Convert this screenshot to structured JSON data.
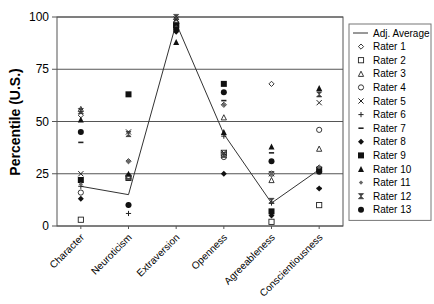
{
  "chart_data": {
    "type": "scatter",
    "title": "",
    "xlabel": "",
    "ylabel": "Percentile (U.S.)",
    "ylim": [
      0,
      100
    ],
    "yticks": [
      0,
      25,
      50,
      75,
      100
    ],
    "grid": "horizontal",
    "legend_position": "right",
    "categories": [
      "Character",
      "Neuroticism",
      "Extraversion",
      "Openness",
      "Agreeableness",
      "Conscientiousness"
    ],
    "series": [
      {
        "name": "Adj. Average",
        "marker": "line",
        "values": [
          19,
          15,
          97,
          44,
          11,
          27
        ]
      },
      {
        "name": "Rater 1",
        "marker": "diamond-open",
        "values": [
          53,
          31,
          99,
          58,
          68,
          28
        ]
      },
      {
        "name": "Rater 2",
        "marker": "square-open",
        "values": [
          3,
          23,
          96,
          35,
          2,
          10
        ]
      },
      {
        "name": "Rater 3",
        "marker": "triangle-open",
        "values": [
          56,
          24,
          98,
          52,
          22,
          37
        ]
      },
      {
        "name": "Rater 4",
        "marker": "circle-open",
        "values": [
          16,
          24,
          97,
          33,
          25,
          46
        ]
      },
      {
        "name": "Rater 5",
        "marker": "x",
        "values": [
          25,
          45,
          99,
          35,
          25,
          59
        ]
      },
      {
        "name": "Rater 6",
        "marker": "plus",
        "values": [
          19,
          6,
          95,
          43,
          11,
          27
        ]
      },
      {
        "name": "Rater 7",
        "marker": "dash",
        "values": [
          40,
          22,
          97,
          60,
          35,
          18
        ]
      },
      {
        "name": "Rater 8",
        "marker": "diamond-filled",
        "values": [
          13,
          10,
          93,
          25,
          5,
          18
        ]
      },
      {
        "name": "Rater 9",
        "marker": "square-filled",
        "values": [
          22,
          63,
          96,
          68,
          7,
          27
        ]
      },
      {
        "name": "Rater 10",
        "marker": "triangle-filled",
        "values": [
          51,
          25,
          88,
          45,
          38,
          66
        ]
      },
      {
        "name": "Rater 11",
        "marker": "diamond-small",
        "values": [
          20,
          31,
          95,
          58,
          25,
          28
        ]
      },
      {
        "name": "Rater 12",
        "marker": "hourglass",
        "values": [
          55,
          44,
          100,
          34,
          12,
          63
        ]
      },
      {
        "name": "Rater 13",
        "marker": "circle-filled",
        "values": [
          45,
          10,
          94,
          64,
          31,
          26
        ]
      }
    ]
  }
}
